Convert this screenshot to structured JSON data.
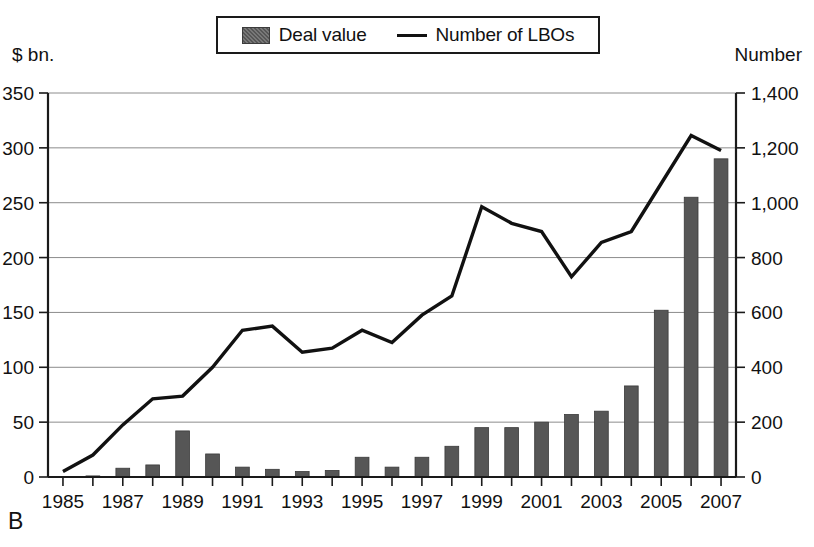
{
  "figure": {
    "panel_label": "B",
    "left_axis_caption": "$ bn.",
    "right_axis_caption": "Number"
  },
  "legend": {
    "items": [
      {
        "label": "Deal value",
        "marker": "bar-swatch-icon",
        "color": "#565656"
      },
      {
        "label": "Number of LBOs",
        "marker": "line-swatch-icon",
        "color": "#111111"
      }
    ]
  },
  "chart_data": {
    "type": "bar",
    "title": "",
    "subtitle": "",
    "xlabel": "",
    "ylabel": "$ bn.",
    "y2label": "Number",
    "grid": true,
    "legend_position": "top-center",
    "categories": [
      "1985",
      "1986",
      "1987",
      "1988",
      "1989",
      "1990",
      "1991",
      "1992",
      "1993",
      "1994",
      "1995",
      "1996",
      "1997",
      "1998",
      "1999",
      "2000",
      "2001",
      "2002",
      "2003",
      "2004",
      "2005",
      "2006",
      "2007"
    ],
    "xtick_labels": [
      "1985",
      "1987",
      "1989",
      "1991",
      "1993",
      "1995",
      "1997",
      "1999",
      "2001",
      "2003",
      "2005",
      "2007"
    ],
    "ylim": [
      0,
      350
    ],
    "ytick_labels": [
      "0",
      "50",
      "100",
      "150",
      "200",
      "250",
      "300",
      "350"
    ],
    "ytick_values": [
      0,
      50,
      100,
      150,
      200,
      250,
      300,
      350
    ],
    "y2lim": [
      0,
      1400
    ],
    "y2tick_labels": [
      "0",
      "200",
      "400",
      "600",
      "800",
      "1,000",
      "1,200",
      "1,400"
    ],
    "y2tick_values": [
      0,
      200,
      400,
      600,
      800,
      1000,
      1200,
      1400
    ],
    "series": [
      {
        "name": "Deal value",
        "kind": "bar",
        "axis": "left",
        "unit": "$ bn.",
        "color": "#565656",
        "values": [
          0.5,
          1,
          8,
          11,
          42,
          21,
          9,
          7,
          5,
          6,
          18,
          9,
          18,
          28,
          45,
          45,
          50,
          57,
          60,
          83,
          152,
          255,
          290
        ]
      },
      {
        "name": "Number of LBOs",
        "kind": "line",
        "axis": "right",
        "unit": "Number",
        "color": "#111111",
        "values": [
          20,
          80,
          190,
          285,
          295,
          400,
          535,
          550,
          455,
          470,
          535,
          490,
          590,
          660,
          985,
          925,
          895,
          730,
          855,
          895,
          1070,
          1245,
          1190
        ]
      }
    ]
  }
}
